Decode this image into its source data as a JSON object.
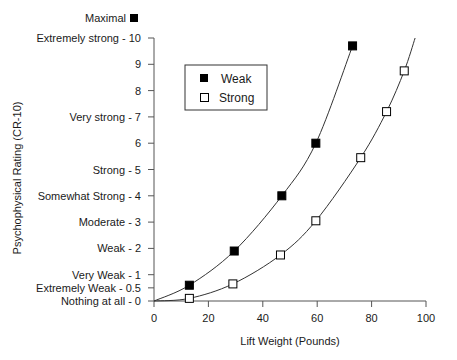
{
  "chart_data": {
    "type": "scatter",
    "title": "",
    "xlabel": "Lift Weight (Pounds)",
    "ylabel": "Psychophysical Rating (CR-10)",
    "xlim": [
      0,
      100
    ],
    "ylim": [
      0,
      10
    ],
    "grid": false,
    "legend_position": "upper-left-inset",
    "x_ticks": [
      {
        "value": 0,
        "label": "0"
      },
      {
        "value": 20,
        "label": "20"
      },
      {
        "value": 40,
        "label": "40"
      },
      {
        "value": 60,
        "label": "60"
      },
      {
        "value": 80,
        "label": "80"
      },
      {
        "value": 100,
        "label": "100"
      }
    ],
    "y_ticks": [
      {
        "value": 0,
        "label": "Nothing at all - 0"
      },
      {
        "value": 0.5,
        "label": "Extremely Weak - 0.5"
      },
      {
        "value": 1,
        "label": "Very Weak - 1"
      },
      {
        "value": 2,
        "label": "Weak - 2"
      },
      {
        "value": 3,
        "label": "Moderate - 3"
      },
      {
        "value": 4,
        "label": "Somewhat Strong - 4"
      },
      {
        "value": 5,
        "label": "Strong - 5"
      },
      {
        "value": 6,
        "label": "6"
      },
      {
        "value": 7,
        "label": "Very strong - 7"
      },
      {
        "value": 8,
        "label": "8"
      },
      {
        "value": 9,
        "label": "9"
      },
      {
        "value": 10,
        "label": "Extremely strong - 10"
      }
    ],
    "annotations": [
      {
        "label": "Maximal",
        "marker": "filled-square",
        "position": "above y-axis top"
      }
    ],
    "series": [
      {
        "name": "Weak",
        "marker": "filled-square",
        "points": [
          {
            "x": 13,
            "y": 0.6
          },
          {
            "x": 29.5,
            "y": 1.9
          },
          {
            "x": 47,
            "y": 4.0
          },
          {
            "x": 59.5,
            "y": 6.0
          },
          {
            "x": 73,
            "y": 9.7
          }
        ],
        "fit_curve": [
          [
            0,
            0
          ],
          [
            13,
            0.6
          ],
          [
            29.5,
            1.9
          ],
          [
            47,
            4.0
          ],
          [
            59.5,
            6.0
          ],
          [
            73,
            9.7
          ]
        ]
      },
      {
        "name": "Strong",
        "marker": "open-square",
        "points": [
          {
            "x": 13,
            "y": 0.1
          },
          {
            "x": 29,
            "y": 0.65
          },
          {
            "x": 46.5,
            "y": 1.75
          },
          {
            "x": 59.5,
            "y": 3.05
          },
          {
            "x": 76,
            "y": 5.45
          },
          {
            "x": 85.5,
            "y": 7.2
          },
          {
            "x": 92,
            "y": 8.75
          }
        ],
        "fit_curve": [
          [
            0,
            0
          ],
          [
            13,
            0.1
          ],
          [
            29,
            0.65
          ],
          [
            46.5,
            1.75
          ],
          [
            59.5,
            3.05
          ],
          [
            76,
            5.45
          ],
          [
            85.5,
            7.2
          ],
          [
            92,
            8.75
          ],
          [
            96,
            10
          ]
        ]
      }
    ]
  },
  "legend": {
    "items": [
      {
        "label": "Weak",
        "marker": "filled-square"
      },
      {
        "label": "Strong",
        "marker": "open-square"
      }
    ]
  },
  "maximal_label": "Maximal"
}
